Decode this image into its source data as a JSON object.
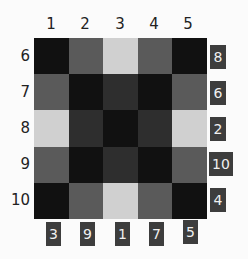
{
  "puzzle": {
    "column_labels": [
      "1",
      "2",
      "3",
      "4",
      "5"
    ],
    "row_labels": [
      "6",
      "7",
      "8",
      "9",
      "10"
    ],
    "grid": [
      [
        "black",
        "medium",
        "light",
        "medium",
        "black"
      ],
      [
        "medium",
        "black",
        "dark",
        "black",
        "medium"
      ],
      [
        "light",
        "dark",
        "black",
        "dark",
        "light"
      ],
      [
        "medium",
        "black",
        "dark",
        "black",
        "medium"
      ],
      [
        "black",
        "medium",
        "light",
        "medium",
        "black"
      ]
    ],
    "right_badges": [
      "8",
      "6",
      "2",
      "10",
      "4"
    ],
    "bottom_badges": [
      "3",
      "9",
      "1",
      "7",
      "5"
    ]
  },
  "colors": {
    "black": "#111111",
    "dark": "#2e2e2e",
    "medium": "#5a5a5a",
    "light": "#d0d0d0",
    "badge_bg": "#3d3d3d",
    "badge_text": "#f0f0f0"
  }
}
